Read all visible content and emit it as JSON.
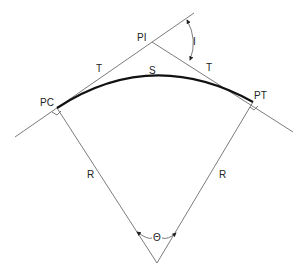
{
  "diagram": {
    "labels": {
      "pi": "PI",
      "pc": "PC",
      "pt": "PT",
      "tangent_left": "T",
      "tangent_right": "T",
      "arc": "S",
      "radius_left": "R",
      "radius_right": "R",
      "deflection_angle": "I",
      "central_angle": "Θ"
    },
    "points": {
      "PI": [
        152,
        42
      ],
      "PC": [
        57,
        108
      ],
      "PT": [
        253,
        102
      ],
      "center": [
        157,
        263
      ]
    },
    "colors": {
      "line": "#6d6d6d",
      "curve": "#111111",
      "text": "#222222",
      "background": "#ffffff"
    }
  }
}
